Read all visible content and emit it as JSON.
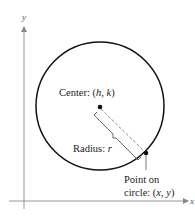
{
  "diagram": {
    "type": "circle-standard-form",
    "axes": {
      "x_label": "x",
      "y_label": "y",
      "color": "#8a8a8a"
    },
    "circle": {
      "stroke": "#111111",
      "center_px": [
        100,
        106
      ],
      "radius_px": 64
    },
    "center_label": {
      "prefix": "Center: ",
      "open": "(",
      "h": "h",
      "sep": ", ",
      "k": "k",
      "close": ")"
    },
    "radius_label": {
      "prefix": "Radius: ",
      "r": "r"
    },
    "point_label": {
      "line1": "Point on",
      "line2_prefix": "circle: ",
      "open": "(",
      "x": "x",
      "sep": ", ",
      "y": "y",
      "close": ")"
    },
    "colors": {
      "ink": "#111111",
      "dashed": "#777777",
      "brace": "#555555"
    }
  }
}
